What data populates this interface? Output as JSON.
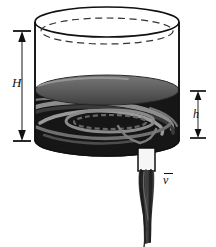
{
  "figure": {
    "labels": {
      "total_height": "H",
      "liquid_depth": "h",
      "efflux_velocity": "v",
      "efflux_velocity_full": "v̄"
    },
    "annotations": {
      "H_description": "Total tank height measured from tank top rim to tank bottom",
      "h_description": "Depth of liquid above the discharge nozzle",
      "v_description": "Mean efflux velocity of the discharging jet"
    },
    "icons": {
      "arrow_up": "arrow-up",
      "arrow_down": "arrow-down"
    },
    "colors": {
      "outline": "#111111",
      "background": "#ffffff",
      "liquid_body": "#1a1a1a",
      "liquid_surface": "#5e5e5e",
      "liquid_surface_light": "#8a8a8a",
      "vortex_highlight": "#9a9a9a",
      "vortex_mid": "#6a6a6a",
      "nozzle_fill": "#f4f4f4",
      "jet_dark": "#2a2a2a",
      "jet_mid": "#4f4f4f",
      "dimension_line": "#111111"
    },
    "geometry": {
      "tank_left_x": 35,
      "tank_right_x": 179,
      "tank_top_y": 22,
      "tank_bottom_y": 140,
      "rim_ellipse_ry": 15,
      "inner_dashed_ellipse_offset_y": 9,
      "liquid_surface_y": 90,
      "nozzle_x": 138,
      "nozzle_top_y": 150,
      "nozzle_bottom_y": 170,
      "nozzle_width": 17,
      "jet_bottom_y": 243
    },
    "dimension_lines": {
      "H": {
        "x": 22,
        "top_y": 30,
        "bottom_y": 141,
        "tick_half_width": 9
      },
      "h": {
        "x": 198,
        "top_y": 91,
        "bottom_y": 138,
        "tick_half_width": 8
      }
    }
  }
}
